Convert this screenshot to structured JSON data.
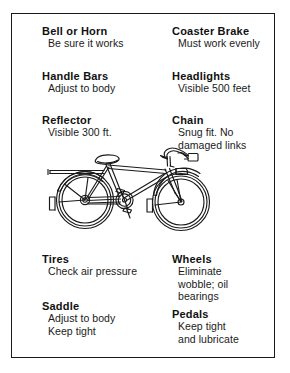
{
  "poster": {
    "title": "Bicycle Safety Check Chart",
    "background_color": "#ffffff",
    "border_color": "#1a1a1a"
  },
  "checklist": {
    "left_column": [
      {
        "title": "Bell or Horn",
        "lines": [
          "Be sure it works"
        ]
      },
      {
        "title": "Handle Bars",
        "lines": [
          "Adjust to body"
        ]
      },
      {
        "title": "Reflector",
        "lines": [
          "Visible 300 ft."
        ]
      },
      {
        "title": "Tires",
        "lines": [
          "Check air pressure"
        ]
      },
      {
        "title": "Saddle",
        "lines": [
          "Adjust to body",
          "Keep tight"
        ]
      }
    ],
    "right_column": [
      {
        "title": "Coaster Brake",
        "lines": [
          "Must work evenly"
        ]
      },
      {
        "title": "Headlights",
        "lines": [
          "Visible 500 feet"
        ]
      },
      {
        "title": "Chain",
        "lines": [
          "Snug fit. No",
          "damaged links"
        ]
      },
      {
        "title": "Wheels",
        "lines": [
          "Eliminate",
          "wobble; oil",
          "bearings"
        ]
      },
      {
        "title": "Pedals",
        "lines": [
          "Keep tight",
          "and lubricate"
        ]
      }
    ]
  },
  "illustration": {
    "name": "bicycle-line-drawing",
    "description": "Side view line drawing of a bicycle facing right",
    "stroke_color": "#1a1a1a"
  }
}
